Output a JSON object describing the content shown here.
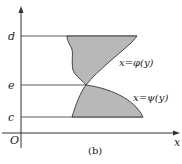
{
  "figure": {
    "caption": "(b)",
    "axes": {
      "x_label": "x",
      "y_label": "",
      "origin_label": "O"
    },
    "y_levels": [
      {
        "name": "d",
        "label": "d"
      },
      {
        "name": "e",
        "label": "e"
      },
      {
        "name": "c",
        "label": "c"
      }
    ],
    "curves": [
      {
        "name": "phi",
        "label": "x=φ(y)"
      },
      {
        "name": "psi",
        "label": "x=ψ(y)"
      }
    ],
    "colors": {
      "fill": "#b8b8b8",
      "stroke": "#333333"
    }
  }
}
